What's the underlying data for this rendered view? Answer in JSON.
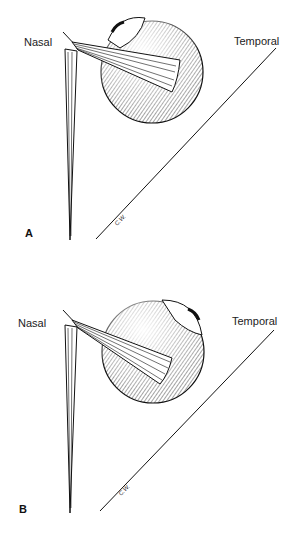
{
  "figure": {
    "panels": [
      {
        "id": "A",
        "label": "A",
        "nasal_label": "Nasal",
        "temporal_label": "Temporal",
        "signature": "C.W."
      },
      {
        "id": "B",
        "label": "B",
        "nasal_label": "Nasal",
        "temporal_label": "Temporal",
        "signature": "C.W."
      }
    ]
  }
}
